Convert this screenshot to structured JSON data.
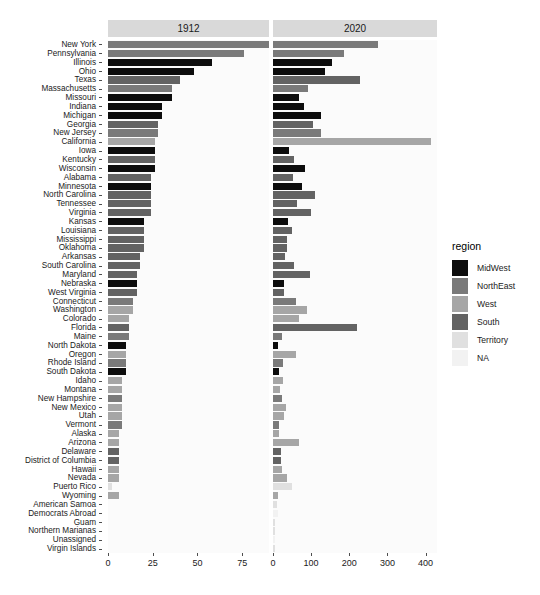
{
  "chart_data": {
    "type": "bar",
    "title": "",
    "xlabel": "",
    "ylabel": "",
    "orientation": "horizontal",
    "grid": false,
    "facet_variable": "year",
    "facets": [
      {
        "label": "1912",
        "xlim": [
          0,
          90
        ],
        "xticks": [
          0,
          25,
          50,
          75
        ]
      },
      {
        "label": "2020",
        "xlim": [
          0,
          430
        ],
        "xticks": [
          0,
          100,
          200,
          300,
          400
        ]
      }
    ],
    "legend": {
      "title": "region",
      "position": "right",
      "entries": [
        {
          "label": "MidWest",
          "color": "#0d0d0d"
        },
        {
          "label": "NorthEast",
          "color": "#7a7a7a"
        },
        {
          "label": "West",
          "color": "#a6a6a6"
        },
        {
          "label": "South",
          "color": "#636363"
        },
        {
          "label": "Territory",
          "color": "#e0e0e0"
        },
        {
          "label": "NA",
          "color": "#f2f2f2"
        }
      ]
    },
    "categories": [
      "Virgin Islands",
      "Unassigned",
      "Northern Marianas",
      "Guam",
      "Democrats Abroad",
      "American Samoa",
      "Wyoming",
      "Puerto Rico",
      "Nevada",
      "Hawaii",
      "District of Columbia",
      "Delaware",
      "Arizona",
      "Alaska",
      "Vermont",
      "Utah",
      "New Mexico",
      "New Hampshire",
      "Montana",
      "Idaho",
      "South Dakota",
      "Rhode Island",
      "Oregon",
      "North Dakota",
      "Maine",
      "Florida",
      "Colorado",
      "Washington",
      "Connecticut",
      "West Virginia",
      "Nebraska",
      "Maryland",
      "South Carolina",
      "Arkansas",
      "Oklahoma",
      "Mississippi",
      "Louisiana",
      "Kansas",
      "Virginia",
      "Tennessee",
      "North Carolina",
      "Minnesota",
      "Alabama",
      "Wisconsin",
      "Kentucky",
      "Iowa",
      "California",
      "New Jersey",
      "Georgia",
      "Michigan",
      "Indiana",
      "Missouri",
      "Massachusetts",
      "Texas",
      "Ohio",
      "Illinois",
      "Pennsylvania",
      "New York"
    ],
    "category_region": [
      "Territory",
      "NA",
      "Territory",
      "Territory",
      "NA",
      "Territory",
      "West",
      "Territory",
      "West",
      "West",
      "South",
      "South",
      "West",
      "West",
      "NorthEast",
      "West",
      "West",
      "NorthEast",
      "West",
      "West",
      "MidWest",
      "NorthEast",
      "West",
      "MidWest",
      "NorthEast",
      "South",
      "West",
      "West",
      "NorthEast",
      "South",
      "MidWest",
      "South",
      "South",
      "South",
      "South",
      "South",
      "South",
      "MidWest",
      "South",
      "South",
      "South",
      "MidWest",
      "South",
      "MidWest",
      "South",
      "MidWest",
      "West",
      "NorthEast",
      "South",
      "MidWest",
      "MidWest",
      "MidWest",
      "NorthEast",
      "South",
      "MidWest",
      "MidWest",
      "NorthEast",
      "NorthEast"
    ],
    "series": [
      {
        "name": "1912",
        "values": [
          0,
          0,
          0,
          0,
          0,
          0,
          6,
          2,
          6,
          6,
          6,
          6,
          6,
          6,
          8,
          8,
          8,
          8,
          8,
          8,
          10,
          10,
          10,
          10,
          12,
          12,
          12,
          14,
          14,
          16,
          16,
          16,
          18,
          18,
          20,
          20,
          20,
          20,
          24,
          24,
          24,
          24,
          24,
          26,
          26,
          26,
          26,
          28,
          28,
          30,
          30,
          36,
          36,
          40,
          48,
          58,
          76,
          90
        ]
      },
      {
        "name": "2020",
        "values": [
          6,
          4,
          6,
          6,
          13,
          11,
          14,
          51,
          36,
          24,
          20,
          21,
          67,
          15,
          16,
          29,
          34,
          24,
          19,
          25,
          16,
          26,
          61,
          14,
          24,
          219,
          67,
          89,
          60,
          28,
          29,
          96,
          54,
          31,
          37,
          36,
          51,
          39,
          99,
          64,
          110,
          75,
          52,
          84,
          54,
          41,
          415,
          126,
          105,
          125,
          82,
          68,
          91,
          228,
          136,
          155,
          186,
          274
        ]
      }
    ]
  }
}
